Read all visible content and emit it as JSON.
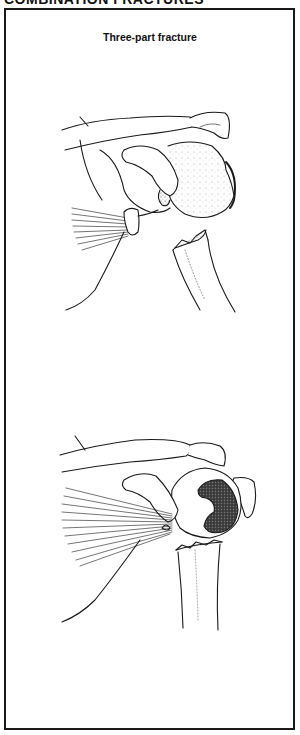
{
  "page": {
    "section_header": "COMBINATION FRACTURES"
  },
  "figure": {
    "title": "Three-part fracture",
    "panels": [
      {
        "name": "upper-illustration",
        "description": "Shoulder with three-part proximal humerus fracture, head displaced and rotated"
      },
      {
        "name": "lower-illustration",
        "description": "Shoulder with three-part fracture showing articular surface of humeral head rotated"
      }
    ]
  },
  "colors": {
    "ink": "#1a1a1a",
    "background": "#ffffff"
  }
}
